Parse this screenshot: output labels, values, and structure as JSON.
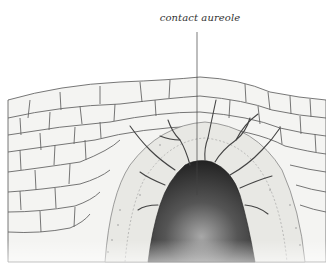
{
  "diagram": {
    "labels": [
      {
        "text": "contact aureole",
        "target": "metamorphosed zone surrounding intrusion"
      }
    ],
    "colors": {
      "background": "#ffffff",
      "rock_fill": "#f4f4f2",
      "rock_lines": "#555555",
      "aureole_fill": "#e6e6e2",
      "intrusion_dark": "#2a2a2a",
      "intrusion_light": "#9a9a9a",
      "label_text": "#333333"
    }
  }
}
